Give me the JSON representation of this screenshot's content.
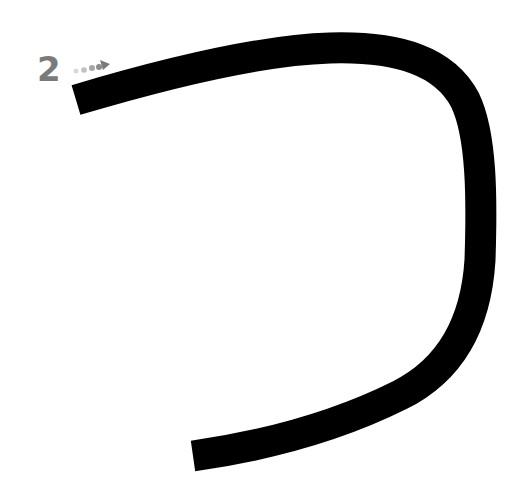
{
  "diagram": {
    "type": "stroke-order",
    "stroke_number": "2",
    "stroke_color": "#000000",
    "number_color": "#7a7a7a",
    "direction_arrow": {
      "dot_colors": [
        "#d9d9d9",
        "#c0c0c0",
        "#a6a6a6",
        "#8c8c8c"
      ],
      "arrowhead_color": "#7a7a7a"
    }
  }
}
